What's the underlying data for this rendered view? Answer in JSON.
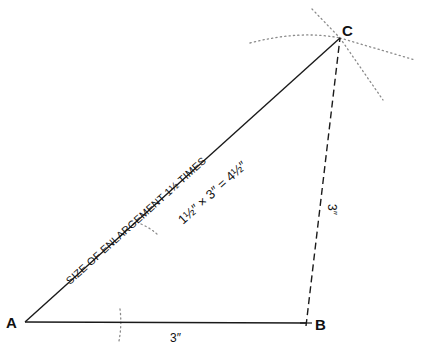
{
  "diagram": {
    "type": "geometric-construction",
    "points": {
      "A": {
        "label": "A",
        "x": 25,
        "y": 322
      },
      "B": {
        "label": "B",
        "x": 306,
        "y": 323
      },
      "C": {
        "label": "C",
        "x": 340,
        "y": 38
      }
    },
    "edges": [
      {
        "from": "A",
        "to": "B",
        "style": "solid",
        "label": "3″"
      },
      {
        "from": "B",
        "to": "C",
        "style": "dashed",
        "label": "3″"
      },
      {
        "from": "A",
        "to": "C",
        "style": "solid",
        "label": "SIZE OF ENLARGEMENT 1½ TIMES"
      }
    ],
    "labels": {
      "vertex_a": "A",
      "vertex_b": "B",
      "vertex_c": "C",
      "ab_length": "3″",
      "bc_length": "3″",
      "ac_caption": "SIZE OF ENLARGEMENT 1½ TIMES",
      "ac_formula": "1½″ × 3″ = 4½″"
    },
    "construction_marks": [
      {
        "type": "dotted-arc",
        "description": "arc intersecting AB near x=120"
      },
      {
        "type": "dotted-arc",
        "description": "small arc below AC"
      },
      {
        "type": "dotted-arc",
        "description": "large arc through C from left"
      },
      {
        "type": "dotted-rays",
        "description": "construction rays radiating from C"
      }
    ],
    "colors": {
      "line": "#1a1a1a",
      "construction": "#8a8a8a",
      "background": "#ffffff"
    }
  }
}
